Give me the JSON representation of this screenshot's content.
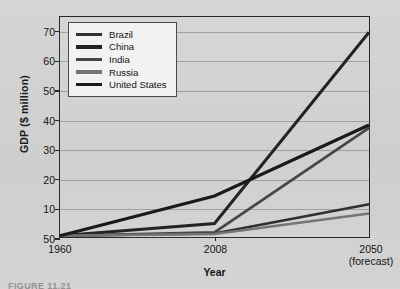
{
  "figure": {
    "caption": "FIGURE 11.21",
    "background_color": "#d2d2d2"
  },
  "chart_data": {
    "type": "line",
    "title": "",
    "xlabel": "Year",
    "ylabel": "GDP ($ million)",
    "x": [
      "1960",
      "2008",
      "2050"
    ],
    "x_tick_labels": [
      {
        "line1": "1960",
        "line2": ""
      },
      {
        "line1": "2008",
        "line2": ""
      },
      {
        "line1": "2050",
        "line2": "(forecast)"
      }
    ],
    "y_tick_labels": [
      "50",
      "10",
      "20",
      "30",
      "40",
      "50",
      "60",
      "70"
    ],
    "y_tick_values": [
      0,
      10,
      20,
      30,
      40,
      50,
      60,
      70
    ],
    "ylim": [
      0,
      75
    ],
    "grid": true,
    "legend_position": "top-left inside",
    "series": [
      {
        "name": "Brazil",
        "color": "#2f2f2f",
        "width": 2.6,
        "values": [
          0.4,
          1.2,
          11.2
        ]
      },
      {
        "name": "China",
        "color": "#232323",
        "width": 3.0,
        "values": [
          0.4,
          4.6,
          69.8
        ]
      },
      {
        "name": "India",
        "color": "#474747",
        "width": 2.8,
        "values": [
          0.4,
          1.6,
          37.2
        ]
      },
      {
        "name": "Russia",
        "color": "#757575",
        "width": 2.6,
        "values": [
          0.4,
          1.0,
          8.0
        ]
      },
      {
        "name": "United States",
        "color": "#1a1a1a",
        "width": 3.2,
        "values": [
          0.4,
          14.0,
          38.2
        ]
      }
    ]
  }
}
